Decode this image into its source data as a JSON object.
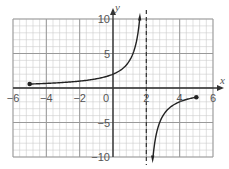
{
  "chart_data": {
    "type": "line",
    "title": "",
    "xlabel": "x",
    "ylabel": "y",
    "xlim": [
      -6,
      6
    ],
    "ylim": [
      -10,
      10
    ],
    "grid": true,
    "minor_grid_step": 0.4,
    "x_ticks": [
      -6,
      -4,
      -2,
      0,
      2,
      4,
      6
    ],
    "y_ticks": [
      10,
      5,
      -5,
      -10
    ],
    "x_tick_labels": [
      "-6",
      "-4",
      "-2",
      "0",
      "2",
      "4",
      "6"
    ],
    "y_tick_labels": [
      "10",
      "5",
      "-5",
      "-10"
    ],
    "vertical_asymptote": 2,
    "function": "y = 4/(2 - x)",
    "series": [
      {
        "name": "left branch",
        "x": [
          -5,
          -4,
          -3,
          -2,
          -1,
          0,
          1,
          1.5,
          1.6
        ],
        "y": [
          0.57,
          0.67,
          0.8,
          1.0,
          1.33,
          2.0,
          4.0,
          8.0,
          10.0
        ],
        "start_point": {
          "x": -5,
          "y": 0.57,
          "closed": true
        },
        "end_arrow": true
      },
      {
        "name": "right branch",
        "x": [
          2.4,
          2.5,
          3,
          3.5,
          4,
          4.5,
          5
        ],
        "y": [
          -10.0,
          -8.0,
          -4.0,
          -2.67,
          -2.0,
          -1.6,
          -1.33
        ],
        "end_point": {
          "x": 5,
          "y": -1.33,
          "closed": true
        },
        "start_arrow": true
      }
    ],
    "colors": {
      "curve": "#222222",
      "grid_major": "#999999",
      "grid_minor": "#cccccc",
      "axis": "#333333"
    }
  }
}
